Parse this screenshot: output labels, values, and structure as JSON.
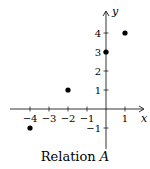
{
  "chart_data": {
    "type": "scatter",
    "title": "Relation A",
    "caption_prefix": "Relation ",
    "caption_var": "A",
    "xlabel": "x",
    "ylabel": "y",
    "xlim": [
      -4.8,
      1.9
    ],
    "ylim": [
      -2.0,
      5.0
    ],
    "x_ticks": [
      -4,
      -3,
      -2,
      -1,
      1
    ],
    "x_tick_labels": [
      "−4",
      "−3",
      "−2",
      "−1",
      "1"
    ],
    "y_ticks": [
      -1,
      1,
      2,
      3,
      4
    ],
    "y_tick_labels": [
      "−1",
      "1",
      "2",
      "3",
      "4"
    ],
    "grid": false,
    "points": [
      {
        "x": -4,
        "y": -1
      },
      {
        "x": -2,
        "y": 1
      },
      {
        "x": 0,
        "y": 3
      },
      {
        "x": 1,
        "y": 4
      }
    ],
    "marker_color": "#000000",
    "axis_color": "#000000"
  }
}
